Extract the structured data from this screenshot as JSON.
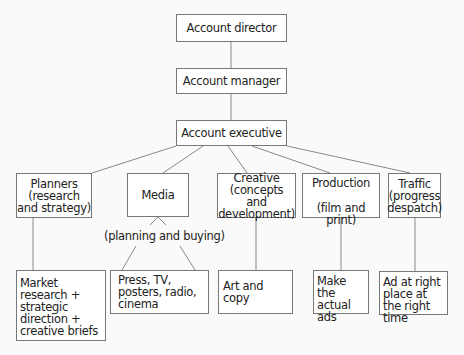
{
  "chart": {
    "top": [
      {
        "id": "director",
        "label": "Account director"
      },
      {
        "id": "manager",
        "label": "Account manager"
      },
      {
        "id": "executive",
        "label": "Account executive"
      }
    ],
    "departments": [
      {
        "id": "planners",
        "label": "Planners (research and strategy)"
      },
      {
        "id": "media",
        "label": "Media",
        "sublabel": "(planning and buying)"
      },
      {
        "id": "creative",
        "label": "Creative (concepts and development)"
      },
      {
        "id": "production",
        "label": "Production",
        "sublabel": "(film and print)"
      },
      {
        "id": "traffic",
        "label": "Traffic (progress despatch)"
      }
    ],
    "outputs": [
      {
        "id": "planners-out",
        "label": "Market research + strategic direction + creative briefs"
      },
      {
        "id": "media-out",
        "label": "Press, TV, posters, radio, cinema"
      },
      {
        "id": "creative-out",
        "label": "Art and copy"
      },
      {
        "id": "production-out",
        "label": "Make the actual ads"
      },
      {
        "id": "traffic-out",
        "label": "Ad at right place at the right time"
      }
    ]
  },
  "colors": {
    "line": "#888888",
    "border": "#777777",
    "text": "#222222"
  }
}
